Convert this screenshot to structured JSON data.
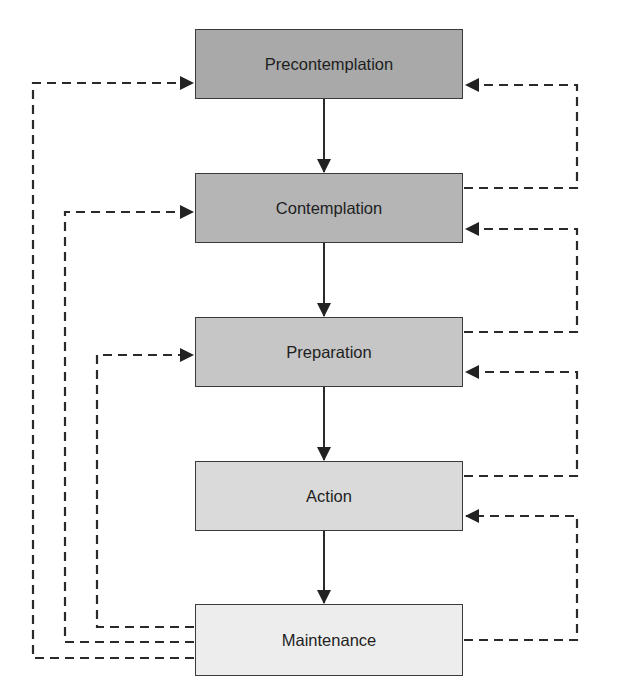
{
  "diagram": {
    "type": "stages-of-change flowchart",
    "stages": [
      {
        "label": "Precontemplation",
        "fill": "#a9a9a9",
        "top": 29,
        "height": 70
      },
      {
        "label": "Contemplation",
        "fill": "#b5b5b5",
        "top": 173,
        "height": 70
      },
      {
        "label": "Preparation",
        "fill": "#c6c6c6",
        "top": 317,
        "height": 70
      },
      {
        "label": "Action",
        "fill": "#dadada",
        "top": 461,
        "height": 70
      },
      {
        "label": "Maintenance",
        "fill": "#ededed",
        "top": 604,
        "height": 72
      }
    ],
    "forward_arrows": [
      {
        "from": "Precontemplation",
        "to": "Contemplation",
        "style": "solid"
      },
      {
        "from": "Contemplation",
        "to": "Preparation",
        "style": "solid"
      },
      {
        "from": "Preparation",
        "to": "Action",
        "style": "solid"
      },
      {
        "from": "Action",
        "to": "Maintenance",
        "style": "solid"
      }
    ],
    "relapse_arrows_left": [
      {
        "from": "Maintenance",
        "to": "Precontemplation",
        "style": "dashed"
      },
      {
        "from": "Maintenance",
        "to": "Contemplation",
        "style": "dashed"
      },
      {
        "from": "Maintenance",
        "to": "Preparation",
        "style": "dashed"
      }
    ],
    "relapse_arrows_right": [
      {
        "from": "Contemplation",
        "to": "Precontemplation",
        "style": "dashed"
      },
      {
        "from": "Preparation",
        "to": "Contemplation",
        "style": "dashed"
      },
      {
        "from": "Action",
        "to": "Preparation",
        "style": "dashed"
      },
      {
        "from": "Maintenance",
        "to": "Action",
        "style": "dashed"
      }
    ],
    "colors": {
      "line": "#2a2a2a",
      "border": "#3a3a3a",
      "background": "#ffffff"
    }
  }
}
